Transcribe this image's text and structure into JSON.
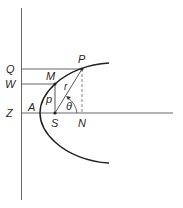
{
  "diagram": {
    "type": "parabola-focus-directrix",
    "colors": {
      "line": "#555555",
      "curve": "#222222",
      "text": "#2a2a2a"
    },
    "points": {
      "P": "P",
      "M": "M",
      "S": "S",
      "N": "N",
      "A": "A",
      "Z": "Z",
      "Q": "Q",
      "W": "W"
    },
    "segment_labels": {
      "r": "r",
      "p": "p",
      "theta": "θ"
    }
  }
}
